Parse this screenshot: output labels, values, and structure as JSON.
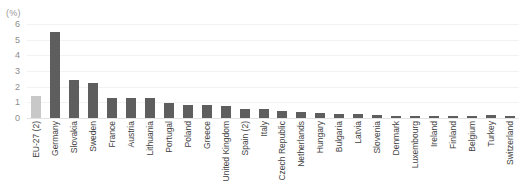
{
  "chart_data": {
    "type": "bar",
    "title": "",
    "subtitle": "",
    "unit_label": "(%)",
    "xlabel": "",
    "ylabel": "",
    "ylim": [
      0,
      6
    ],
    "ytick_step": 1,
    "yticks": [
      "0",
      "1",
      "2",
      "3",
      "4",
      "5",
      "6"
    ],
    "grid": true,
    "grid_axis": "y",
    "legend": "none",
    "orientation": "vertical",
    "categories": [
      "EU-27 (2)",
      "Germany",
      "Slovakia",
      "Sweden",
      "France",
      "Austria",
      "Lithuania",
      "Portugal",
      "Poland",
      "Greece",
      "United Kingdom",
      "Spain (2)",
      "Italy",
      "Czech Republic",
      "Netherlands",
      "Hungary",
      "Bulgaria",
      "Latvia",
      "Slovenia",
      "Denmark",
      "Luxembourg",
      "Ireland",
      "Finland",
      "Belgium",
      "Turkey",
      "Switzerland"
    ],
    "values": [
      1.4,
      5.5,
      2.45,
      2.25,
      1.3,
      1.25,
      1.25,
      0.95,
      0.85,
      0.8,
      0.75,
      0.6,
      0.55,
      0.45,
      0.4,
      0.3,
      0.25,
      0.25,
      0.2,
      0.15,
      0.12,
      0.1,
      0.1,
      0.1,
      0.2,
      0.12
    ],
    "highlight_index": 0,
    "colors": {
      "bar": "#5e5e5e",
      "bar_highlight": "#c8c8c8",
      "gridline": "#f2f2f2",
      "baseline": "#e3e3e3",
      "tick_text": "#8d8d8d",
      "category_text": "#3f3f3f",
      "unit_text": "#9a9a9a",
      "background": "#ffffff"
    }
  }
}
